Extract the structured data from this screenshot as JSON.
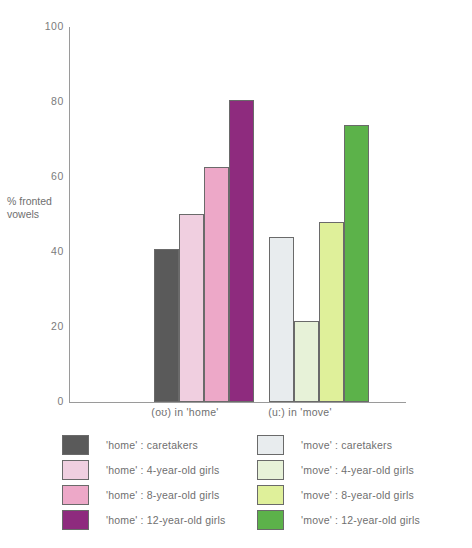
{
  "chart_data": {
    "type": "bar",
    "title": "",
    "xlabel": "",
    "ylabel": "% fronted vowels",
    "ylim": [
      0,
      100
    ],
    "yticks": [
      0,
      20,
      40,
      60,
      80,
      100
    ],
    "ytick_labels": [
      "0",
      "20",
      "40",
      "60",
      "80",
      "100"
    ],
    "grid": false,
    "legend_position": "below-plot, two columns",
    "categories": [
      "(oʊ) in 'home'",
      "(u:) in  'move'"
    ],
    "series": [
      {
        "name": "caretakers",
        "values": [
          40.9,
          44.1
        ],
        "colors": [
          "#5a5a5a",
          "#e8ecee"
        ]
      },
      {
        "name": "4-year-old girls",
        "values": [
          50.2,
          21.6
        ],
        "colors": [
          "#f0cfe0",
          "#e7f2d8"
        ]
      },
      {
        "name": "8-year-old girls",
        "values": [
          62.8,
          48.1
        ],
        "colors": [
          "#eda8c8",
          "#dff09a"
        ]
      },
      {
        "name": "12-year-old girls",
        "values": [
          80.6,
          74.0
        ],
        "colors": [
          "#8e2b7e",
          "#5cb24a"
        ]
      }
    ]
  },
  "axis": {
    "y_title": "% fronted vowels",
    "ticks": [
      "100",
      "80",
      "60",
      "40",
      "20",
      "0"
    ]
  },
  "groups": [
    {
      "label": "(oʊ) in 'home'"
    },
    {
      "label": "(u:) in  'move'"
    }
  ],
  "legend": {
    "left_column": [
      {
        "label": "'home' : caretakers",
        "color": "#5a5a5a"
      },
      {
        "label": "'home' : 4-year-old girls",
        "color": "#f0cfe0"
      },
      {
        "label": "'home' : 8-year-old girls",
        "color": "#eda8c8"
      },
      {
        "label": "'home' : 12-year-old girls",
        "color": "#8e2b7e"
      }
    ],
    "right_column": [
      {
        "label": "'move' : caretakers",
        "color": "#e8ecee"
      },
      {
        "label": "'move' : 4-year-old girls",
        "color": "#e7f2d8"
      },
      {
        "label": "'move' : 8-year-old girls",
        "color": "#dff09a"
      },
      {
        "label": "'move' : 12-year-old girls",
        "color": "#5cb24a"
      }
    ]
  },
  "caption": {
    "text": ""
  }
}
